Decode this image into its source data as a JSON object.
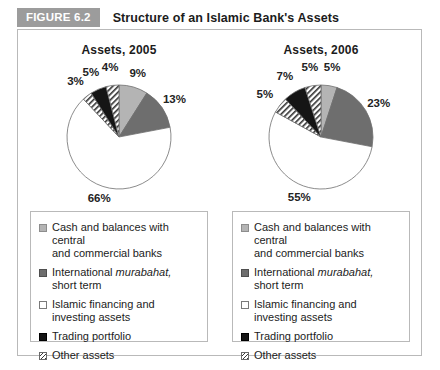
{
  "figure": {
    "badge": "FIGURE 6.2",
    "title": "Structure of an Islamic Bank's Assets"
  },
  "colors": {
    "badge_bg": "#9c9c9c",
    "frame_border": "#b9b9b9",
    "cash": "#b4b4b4",
    "murabahat": "#6e6e6e",
    "islamic_financing": "#ffffff",
    "trading": "#151515",
    "other": "#ffffff"
  },
  "legend": {
    "items": [
      {
        "swatch": "light-gray-square",
        "line1": "Cash and balances with central",
        "line2": "and commercial banks"
      },
      {
        "swatch": "dark-gray-square",
        "line1": "International murabahat,",
        "line2": "short term"
      },
      {
        "swatch": "white-square",
        "line1": "Islamic financing and",
        "line2": "investing assets"
      },
      {
        "swatch": "black-square",
        "line1": "Trading portfolio",
        "line2": ""
      },
      {
        "swatch": "hatched-square",
        "line1": "Other assets",
        "line2": ""
      }
    ]
  },
  "chart_data": [
    {
      "type": "pie",
      "title": "Assets, 2005",
      "categories": [
        "Cash and balances with central and commercial banks",
        "International murabahat, short term",
        "Islamic financing and investing assets",
        "Other assets",
        "Trading portfolio",
        "Other assets"
      ],
      "values": [
        9,
        13,
        66,
        3,
        5,
        4
      ],
      "labels": [
        "9%",
        "13%",
        "66%",
        "3%",
        "5%",
        "4%"
      ],
      "fills": [
        "light-gray",
        "mid-gray",
        "white",
        "hatched",
        "black",
        "hatched"
      ],
      "start_angle_deg": 0,
      "direction": "clockwise"
    },
    {
      "type": "pie",
      "title": "Assets, 2006",
      "categories": [
        "Cash and balances with central and commercial banks",
        "International murabahat, short term",
        "Islamic financing and investing assets",
        "Other assets",
        "Trading portfolio",
        "Other assets"
      ],
      "values": [
        5,
        23,
        55,
        5,
        7,
        5
      ],
      "labels": [
        "5%",
        "23%",
        "55%",
        "5%",
        "7%",
        "5%"
      ],
      "fills": [
        "light-gray",
        "mid-gray",
        "white",
        "hatched",
        "black",
        "hatched"
      ],
      "start_angle_deg": 0,
      "direction": "clockwise"
    }
  ]
}
